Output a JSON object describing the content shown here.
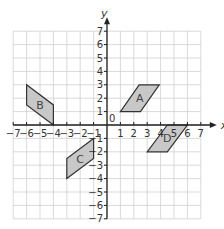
{
  "diagram": {
    "type": "coordinate-grid",
    "axes": {
      "x_label": "x",
      "y_label": "y",
      "x_range": [
        -7,
        7
      ],
      "y_range": [
        -7,
        7
      ]
    },
    "x_ticks": [
      "-7",
      "-6",
      "-5",
      "-4",
      "-3",
      "-2",
      "-1",
      "1",
      "2",
      "3",
      "4",
      "5",
      "6",
      "7"
    ],
    "y_ticks": [
      "7",
      "6",
      "5",
      "4",
      "3",
      "2",
      "1",
      "-1",
      "-2",
      "-3",
      "-4",
      "-5",
      "-6",
      "-7"
    ],
    "origin_label": "0",
    "shapes": [
      {
        "label": "A",
        "points": [
          [
            1,
            1
          ],
          [
            2.5,
            1
          ],
          [
            3.9,
            3
          ],
          [
            2.4,
            3
          ]
        ]
      },
      {
        "label": "B",
        "points": [
          [
            -6,
            3
          ],
          [
            -6,
            1.5
          ],
          [
            -4,
            0
          ],
          [
            -4,
            1.5
          ]
        ]
      },
      {
        "label": "C",
        "points": [
          [
            -3,
            -4
          ],
          [
            -3,
            -2.5
          ],
          [
            -1,
            -1
          ],
          [
            -1,
            -2.5
          ]
        ]
      },
      {
        "label": "D",
        "points": [
          [
            3,
            -2
          ],
          [
            4.5,
            -2
          ],
          [
            6,
            0
          ],
          [
            4.5,
            0
          ]
        ]
      }
    ],
    "colors": {
      "grid": "#cfcfcf",
      "axis": "#222222",
      "fill": "#c8c8c8",
      "stroke": "#333333"
    }
  }
}
